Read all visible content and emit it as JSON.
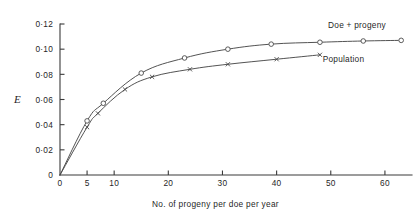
{
  "chart_data": {
    "type": "line",
    "title": "",
    "xlabel": "No. of progeny per doe per year",
    "ylabel": "E",
    "xlim": [
      0,
      65
    ],
    "ylim": [
      0,
      0.12
    ],
    "grid": false,
    "legend_position": "inline-right",
    "x_ticks": [
      {
        "value": 0,
        "label": "0"
      },
      {
        "value": 5,
        "label": "5"
      },
      {
        "value": 10,
        "label": "10"
      },
      {
        "value": 20,
        "label": "20"
      },
      {
        "value": 30,
        "label": "30"
      },
      {
        "value": 40,
        "label": "40"
      },
      {
        "value": 50,
        "label": "50"
      },
      {
        "value": 60,
        "label": "60"
      }
    ],
    "y_ticks": [
      {
        "value": 0,
        "label": "0"
      },
      {
        "value": 0.02,
        "label": "0·02"
      },
      {
        "value": 0.04,
        "label": "0·04"
      },
      {
        "value": 0.06,
        "label": "0·06"
      },
      {
        "value": 0.08,
        "label": "0·08"
      },
      {
        "value": 0.1,
        "label": "0·10"
      },
      {
        "value": 0.12,
        "label": "0·12"
      }
    ],
    "series": [
      {
        "name": "Doe + progeny",
        "marker": "circle",
        "annotation": "Doe + progeny",
        "points": [
          {
            "x": 0,
            "y": 0
          },
          {
            "x": 5,
            "y": 0.043
          },
          {
            "x": 8,
            "y": 0.057
          },
          {
            "x": 15,
            "y": 0.081
          },
          {
            "x": 23,
            "y": 0.093
          },
          {
            "x": 31,
            "y": 0.1
          },
          {
            "x": 39,
            "y": 0.104
          },
          {
            "x": 48,
            "y": 0.1055
          },
          {
            "x": 56,
            "y": 0.1065
          },
          {
            "x": 63,
            "y": 0.107
          }
        ],
        "marker_points": [
          {
            "x": 5,
            "y": 0.043
          },
          {
            "x": 8,
            "y": 0.057
          },
          {
            "x": 15,
            "y": 0.081
          },
          {
            "x": 23,
            "y": 0.093
          },
          {
            "x": 31,
            "y": 0.1
          },
          {
            "x": 39,
            "y": 0.104
          },
          {
            "x": 48,
            "y": 0.1055
          },
          {
            "x": 56,
            "y": 0.1065
          },
          {
            "x": 63,
            "y": 0.107
          }
        ]
      },
      {
        "name": "Population",
        "marker": "cross",
        "annotation": "Population",
        "points": [
          {
            "x": 0,
            "y": 0
          },
          {
            "x": 5,
            "y": 0.038
          },
          {
            "x": 7,
            "y": 0.049
          },
          {
            "x": 12,
            "y": 0.068
          },
          {
            "x": 17,
            "y": 0.078
          },
          {
            "x": 24,
            "y": 0.084
          },
          {
            "x": 31,
            "y": 0.088
          },
          {
            "x": 40,
            "y": 0.092
          },
          {
            "x": 48,
            "y": 0.0955
          }
        ],
        "marker_points": [
          {
            "x": 5,
            "y": 0.038
          },
          {
            "x": 7,
            "y": 0.049
          },
          {
            "x": 12,
            "y": 0.068
          },
          {
            "x": 17,
            "y": 0.078
          },
          {
            "x": 24,
            "y": 0.084
          },
          {
            "x": 31,
            "y": 0.088
          },
          {
            "x": 40,
            "y": 0.092
          },
          {
            "x": 48,
            "y": 0.0955
          }
        ]
      }
    ],
    "annotations": [
      {
        "text": "Doe + progeny",
        "x": 49.5,
        "y": 0.1165
      },
      {
        "text": "Population",
        "x": 48.5,
        "y": 0.0895
      }
    ],
    "colors": {
      "axis": "#3a3a3a",
      "curve": "#4a4a4a",
      "text": "#1f1f1f",
      "background": "#ffffff"
    }
  }
}
